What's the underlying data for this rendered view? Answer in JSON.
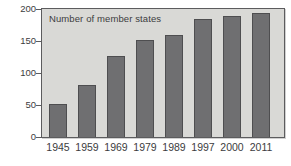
{
  "figure": {
    "title": "Number of member states"
  },
  "colors": {
    "canvas_bg": "#ffffff",
    "plot_bg": "#d9d9d6",
    "bar_fill": "#6f6f71",
    "bar_border": "#4e4e50",
    "frame": "#5c5c5e",
    "text": "#3c3c3e"
  },
  "chart_data": {
    "type": "bar",
    "title": "Number of member states",
    "categories": [
      "1945",
      "1959",
      "1969",
      "1979",
      "1989",
      "1997",
      "2000",
      "2011"
    ],
    "values": [
      51,
      82,
      126,
      152,
      159,
      185,
      189,
      193
    ],
    "xlabel": "",
    "ylabel": "",
    "ylim": [
      0,
      200
    ],
    "yticks": [
      0,
      50,
      100,
      150,
      200
    ],
    "grid": false,
    "legend": "none",
    "title_position": "inside-top-left",
    "bar_color": "#6f6f71",
    "plot_background": "#d9d9d6"
  }
}
